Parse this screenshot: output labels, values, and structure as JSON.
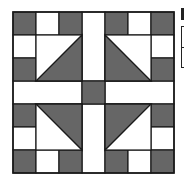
{
  "diagram": {
    "title": "",
    "type": "quilt-block",
    "grid_units": 7,
    "colors": {
      "dark": "#666666",
      "light": "#ffffff",
      "line": "#1a1a1a"
    },
    "squares": [
      {
        "row": 0,
        "col": 0,
        "fill": "dark"
      },
      {
        "row": 0,
        "col": 1,
        "fill": "light"
      },
      {
        "row": 0,
        "col": 2,
        "fill": "dark"
      },
      {
        "row": 0,
        "col": 4,
        "fill": "dark"
      },
      {
        "row": 0,
        "col": 5,
        "fill": "light"
      },
      {
        "row": 0,
        "col": 6,
        "fill": "dark"
      },
      {
        "row": 1,
        "col": 0,
        "fill": "light"
      },
      {
        "row": 1,
        "col": 6,
        "fill": "light"
      },
      {
        "row": 2,
        "col": 0,
        "fill": "dark"
      },
      {
        "row": 2,
        "col": 6,
        "fill": "dark"
      },
      {
        "row": 3,
        "col": 3,
        "fill": "dark"
      },
      {
        "row": 4,
        "col": 0,
        "fill": "dark"
      },
      {
        "row": 4,
        "col": 6,
        "fill": "dark"
      },
      {
        "row": 5,
        "col": 0,
        "fill": "light"
      },
      {
        "row": 5,
        "col": 6,
        "fill": "light"
      },
      {
        "row": 6,
        "col": 0,
        "fill": "dark"
      },
      {
        "row": 6,
        "col": 1,
        "fill": "light"
      },
      {
        "row": 6,
        "col": 2,
        "fill": "dark"
      },
      {
        "row": 6,
        "col": 4,
        "fill": "dark"
      },
      {
        "row": 6,
        "col": 5,
        "fill": "light"
      },
      {
        "row": 6,
        "col": 6,
        "fill": "dark"
      }
    ],
    "sashing": [
      {
        "name": "sash-top",
        "row": 0,
        "col": 3,
        "rows": 3,
        "cols": 1
      },
      {
        "name": "sash-bottom",
        "row": 4,
        "col": 3,
        "rows": 3,
        "cols": 1
      },
      {
        "name": "sash-left",
        "row": 3,
        "col": 0,
        "rows": 1,
        "cols": 3
      },
      {
        "name": "sash-right",
        "row": 3,
        "col": 4,
        "rows": 1,
        "cols": 3
      }
    ],
    "triangle_units": [
      {
        "name": "top-left",
        "row": 1,
        "col": 1,
        "dark_corner": "bottom-right"
      },
      {
        "name": "top-right",
        "row": 1,
        "col": 4,
        "dark_corner": "bottom-left"
      },
      {
        "name": "bottom-left",
        "row": 4,
        "col": 1,
        "dark_corner": "top-right"
      },
      {
        "name": "bottom-right",
        "row": 4,
        "col": 4,
        "dark_corner": "top-left"
      }
    ]
  }
}
